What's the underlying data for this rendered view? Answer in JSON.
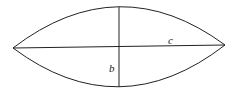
{
  "diagram": {
    "title": "",
    "shape": "lens",
    "points": {
      "left_tip": [
        13,
        48
      ],
      "right_tip": [
        225,
        45
      ],
      "top": [
        119,
        7
      ],
      "bottom": [
        119,
        87
      ]
    },
    "labels": {
      "c": "c",
      "b": "b"
    },
    "stroke_color": "#222222"
  }
}
